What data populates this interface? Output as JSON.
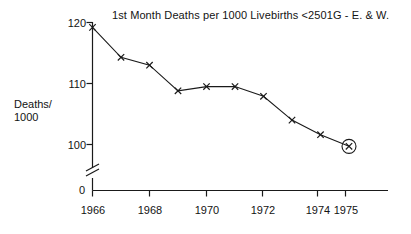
{
  "chart_data": {
    "type": "line",
    "title": "1st Month Deaths per 1000 Livebirths  <2501G - E. & W.",
    "xlabel": "",
    "ylabel": "Deaths/\n1000",
    "ylabel_line1": "Deaths/",
    "ylabel_line2": "1000",
    "x": [
      1966,
      1967,
      1968,
      1969,
      1970,
      1971,
      1972,
      1973,
      1974,
      1975
    ],
    "values": [
      119.2,
      114.3,
      113.0,
      108.8,
      109.5,
      109.5,
      107.9,
      104.0,
      101.6,
      99.7
    ],
    "series": [
      {
        "name": "1st Month Deaths per 1000 Livebirths <2501G",
        "values": [
          119.2,
          114.3,
          113.0,
          108.8,
          109.5,
          109.5,
          107.9,
          104.0,
          101.6,
          99.7
        ]
      }
    ],
    "ylim": [
      95,
      121
    ],
    "ytick_labels": [
      "120",
      "110",
      "100"
    ],
    "ytick_values": [
      120,
      110,
      100
    ],
    "xtick_labels": [
      "1966",
      "1968",
      "1970",
      "1972",
      "1974",
      "1975"
    ],
    "xtick_values": [
      1966,
      1968,
      1970,
      1972,
      1974,
      1975
    ],
    "origin_label": "0",
    "grid": false,
    "legend": false,
    "marker": "x",
    "axis_break": true,
    "axis_break_note": "y-axis broken between 0 and 100",
    "highlight": {
      "point_index": 9,
      "x": 1975,
      "value": 99.7,
      "style": "circled"
    },
    "line_color": "#1a1a1a",
    "axis_color": "#1a1a1a",
    "background_color": "#ffffff"
  },
  "axes": {
    "y_axis_name": "deaths-per-1000-axis",
    "x_axis_name": "year-axis"
  }
}
